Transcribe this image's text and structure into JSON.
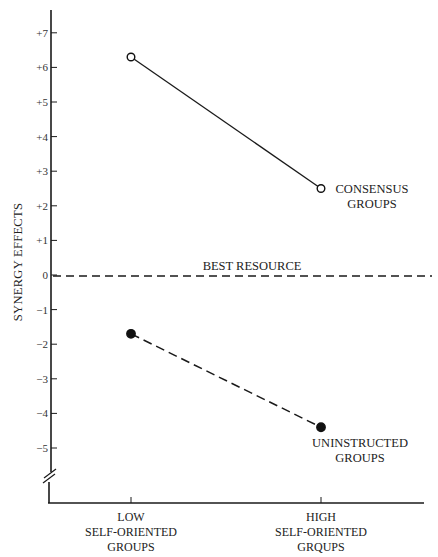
{
  "chart_data": {
    "type": "line",
    "title": "",
    "xlabel": "",
    "ylabel": "SYNERGY EFFECTS",
    "categories": [
      "LOW SELF-ORIENTED GROUPS",
      "HIGH SELF-ORIENTED GROUPS"
    ],
    "category_lines": [
      [
        "LOW",
        "SELF-ORIENTED",
        "GROUPS"
      ],
      [
        "HIGH",
        "SELF-ORIENTED",
        "GRQUPS"
      ]
    ],
    "y_ticks": [
      7,
      6,
      5,
      4,
      3,
      2,
      1,
      0,
      -1,
      -2,
      -3,
      -4,
      -5
    ],
    "y_tick_labels": [
      "+7",
      "+6",
      "+5",
      "+4",
      "+3",
      "+2",
      "+1",
      "0",
      "−1",
      "−2",
      "−3",
      "−4",
      "−5"
    ],
    "ylim": [
      -5.5,
      7.5
    ],
    "axis_break": true,
    "grid": false,
    "series": [
      {
        "name": "CONSENSUS GROUPS",
        "label_lines": [
          "CONSENSUS",
          "GROUPS"
        ],
        "values": [
          6.3,
          2.5
        ],
        "marker": "open-circle",
        "line_style": "solid"
      },
      {
        "name": "UNINSTRUCTED GROUPS",
        "label_lines": [
          "UNINSTRUCTED",
          "GROUPS"
        ],
        "values": [
          -1.7,
          -4.4
        ],
        "marker": "filled-circle",
        "line_style": "dashed"
      }
    ],
    "reference_lines": [
      {
        "name": "BEST RESOURCE",
        "y": 0,
        "line_style": "dashed"
      }
    ]
  }
}
